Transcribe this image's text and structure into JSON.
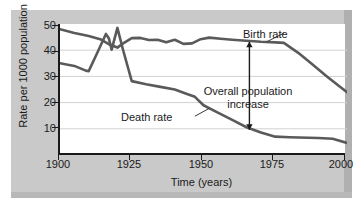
{
  "chart_data": {
    "type": "line",
    "title": "",
    "xlabel": "Time (years)",
    "ylabel": "Rate per 1000 population",
    "xlim": [
      1900,
      2000
    ],
    "ylim": [
      0,
      50
    ],
    "xticks": [
      1900,
      1925,
      1950,
      1975,
      2000
    ],
    "yticks": [
      10,
      20,
      30,
      40,
      50
    ],
    "grid": "horizontal",
    "legend": "inline-labels",
    "series": [
      {
        "name": "Birth rate",
        "color": "#5a5a5a",
        "points": [
          [
            1900,
            48.0
          ],
          [
            1905,
            46.6
          ],
          [
            1910,
            45.4
          ],
          [
            1914,
            44.2
          ],
          [
            1917,
            42.3
          ],
          [
            1920,
            41.0
          ],
          [
            1922,
            42.6
          ],
          [
            1925,
            44.6
          ],
          [
            1928,
            44.7
          ],
          [
            1931,
            43.9
          ],
          [
            1934,
            44.0
          ],
          [
            1937,
            43.0
          ],
          [
            1940,
            44.0
          ],
          [
            1943,
            42.4
          ],
          [
            1946,
            42.6
          ],
          [
            1949,
            44.2
          ],
          [
            1952,
            44.8
          ],
          [
            1956,
            44.4
          ],
          [
            1960,
            44.0
          ],
          [
            1965,
            43.6
          ],
          [
            1970,
            43.2
          ],
          [
            1975,
            43.0
          ],
          [
            1978,
            42.8
          ],
          [
            1983,
            39.0
          ],
          [
            1988,
            34.5
          ],
          [
            1993,
            30.0
          ],
          [
            1997,
            26.5
          ],
          [
            2000,
            24.0
          ]
        ]
      },
      {
        "name": "Death rate",
        "color": "#5a5a5a",
        "points": [
          [
            1900,
            35.0
          ],
          [
            1905,
            34.0
          ],
          [
            1909,
            32.2
          ],
          [
            1910,
            32.0
          ],
          [
            1913,
            39.0
          ],
          [
            1916,
            46.2
          ],
          [
            1917,
            44.6
          ],
          [
            1918,
            40.2
          ],
          [
            1920,
            48.5
          ],
          [
            1922,
            40.0
          ],
          [
            1925,
            28.2
          ],
          [
            1930,
            27.0
          ],
          [
            1935,
            26.0
          ],
          [
            1940,
            25.0
          ],
          [
            1944,
            23.4
          ],
          [
            1947,
            22.2
          ],
          [
            1950,
            19.0
          ],
          [
            1955,
            16.2
          ],
          [
            1960,
            13.4
          ],
          [
            1965,
            10.6
          ],
          [
            1970,
            8.6
          ],
          [
            1975,
            7.0
          ],
          [
            1980,
            6.8
          ],
          [
            1990,
            6.5
          ],
          [
            1995,
            6.2
          ],
          [
            2000,
            4.6
          ]
        ]
      }
    ],
    "annotations": [
      {
        "name": "birth-rate-label",
        "text": "Birth rate",
        "leader_from": [
          1972,
          43.2
        ],
        "leader_to": [
          1978,
          46.5
        ]
      },
      {
        "name": "death-rate-label",
        "text": "Death rate",
        "leader_from": [
          1952,
          17.8
        ],
        "leader_to": [
          1947,
          14.8
        ]
      },
      {
        "name": "overall-population-increase",
        "text_line_1": "Overall population",
        "text_line_2": "increase",
        "arrow_x": 1966,
        "arrow_top": 43.2,
        "arrow_bottom": 9.6,
        "style": "double-headed-vertical-arrow"
      }
    ]
  },
  "axes": {
    "y_title": "Rate per 1000 population",
    "x_title": "Time (years)",
    "y_tick_labels": [
      "50",
      "40",
      "30",
      "20",
      "10"
    ],
    "x_tick_labels": [
      "1900",
      "1925",
      "1950",
      "1975",
      "2000"
    ]
  }
}
